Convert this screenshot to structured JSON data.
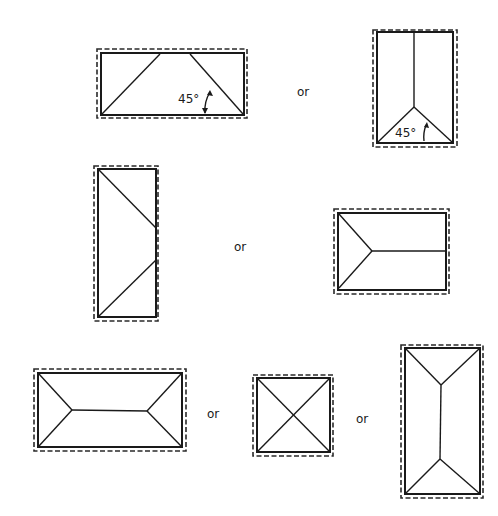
{
  "diagram": {
    "title": "",
    "connector_label": "or",
    "angle_label": "45°",
    "colors": {
      "line": "#1a1a1a",
      "background": "#ffffff"
    },
    "groups": [
      {
        "name": "row-1",
        "shapes": [
          {
            "id": "hip-roof-wide-pitched-sides",
            "annotation": "45°"
          },
          {
            "id": "hip-roof-tall-one-end",
            "annotation": "45°"
          }
        ],
        "separator": "or"
      },
      {
        "name": "row-2",
        "shapes": [
          {
            "id": "half-hip-tall-side"
          },
          {
            "id": "half-hip-wide-one-end"
          }
        ],
        "separator": "or"
      },
      {
        "name": "row-3",
        "shapes": [
          {
            "id": "hip-roof-wide-both-ends"
          },
          {
            "id": "pyramid-roof-square"
          },
          {
            "id": "hip-roof-tall-both-ends"
          }
        ],
        "separators": [
          "or",
          "or"
        ]
      }
    ]
  },
  "labels": {
    "or_1": "or",
    "or_2": "or",
    "or_3": "or",
    "or_4": "or",
    "angle_1": "45°",
    "angle_2": "45°"
  }
}
